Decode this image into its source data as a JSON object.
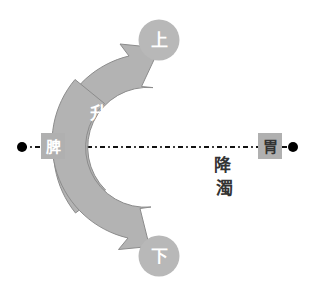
{
  "diagram": {
    "colors": {
      "arrow_fill": "#b3b3b3",
      "arrow_stroke": "#8c8c8c",
      "node_circle_fill": "#b8b8b8",
      "node_square_fill": "#b0b0b0",
      "axis_line": "#111111",
      "endpoint_dot": "#000000",
      "light_label_text": "#ffffff",
      "dark_label_text": "#333333",
      "background": "#ffffff"
    },
    "nodes": {
      "top": {
        "label": "上",
        "shape": "circle"
      },
      "bottom": {
        "label": "下",
        "shape": "circle"
      },
      "left": {
        "label": "脾",
        "shape": "square"
      },
      "right": {
        "label": "胃",
        "shape": "square"
      }
    },
    "arrows": {
      "ascending": {
        "label_chars": [
          "升",
          "清"
        ],
        "label": "升清",
        "direction": "up",
        "side": "left",
        "text_color": "light"
      },
      "descending": {
        "label_chars": [
          "降",
          "濁"
        ],
        "label": "降濁",
        "direction": "down",
        "side": "right",
        "text_color": "dark"
      }
    },
    "axis": {
      "style": "dash-dot",
      "left_endpoint": "dot",
      "right_endpoint": "dot"
    }
  }
}
